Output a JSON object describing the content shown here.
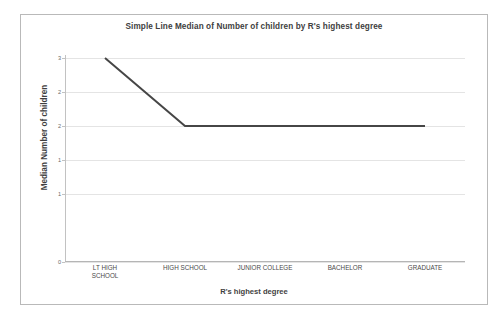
{
  "chart_data": {
    "type": "line",
    "title": "Simple Line Median of Number of children by R's highest degree",
    "xlabel": "R's highest degree",
    "ylabel": "Median Number of children",
    "categories": [
      "LT HIGH\nSCHOOL",
      "HIGH SCHOOL",
      "JUNIOR COLLEGE",
      "BACHELOR",
      "GRADUATE"
    ],
    "values": [
      3,
      2,
      2,
      2,
      2
    ],
    "ylim": [
      0,
      3
    ],
    "ytick_values": [
      3,
      2.5,
      2,
      1.5,
      1,
      0.5,
      0
    ],
    "ytick_labels": [
      "3",
      "2",
      "2",
      "1",
      "1",
      "0"
    ],
    "ytick_positions": [
      3,
      2.5,
      2,
      1.5,
      1,
      0
    ],
    "grid": true,
    "legend": false,
    "line_color": "#464646",
    "grid_color": "#e4e4e4",
    "axis_color": "#c2c2c2",
    "frame_border_color": "#b9b9b9",
    "background_color": "#ffffff"
  }
}
